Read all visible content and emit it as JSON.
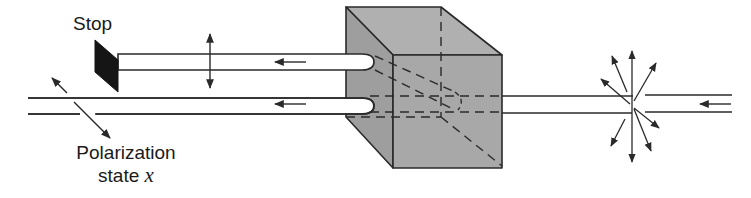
{
  "diagram": {
    "labels": {
      "stop": "Stop",
      "polarization_line1": "Polarization",
      "polarization_line2_prefix": "state ",
      "polarization_var": "x"
    },
    "colors": {
      "cube_fill": "#a6a6a6",
      "cube_top": "#b4b4b4",
      "cube_left": "#9c9c9c",
      "line": "#2a2a2a",
      "stop_fill": "#151515",
      "beam_fill": "#ffffff"
    },
    "elements": [
      {
        "id": "stop",
        "type": "absorber",
        "label": "Stop"
      },
      {
        "id": "upper-beam",
        "direction": "left",
        "polarization": "vertical"
      },
      {
        "id": "lower-beam",
        "direction": "left",
        "polarization": "state x (diagonal)"
      },
      {
        "id": "cube",
        "type": "beam-splitter-cube"
      },
      {
        "id": "input-beam",
        "direction": "left",
        "polarization": "unpolarized (starburst)"
      }
    ]
  }
}
